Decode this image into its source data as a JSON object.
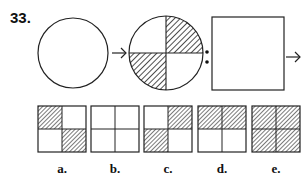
{
  "question": {
    "number": "33.",
    "sequence": [
      {
        "type": "circle",
        "divided": false,
        "shaded_quadrants": []
      },
      {
        "type": "circle",
        "divided": true,
        "shaded_quadrants": [
          "top-right",
          "bottom-left"
        ]
      },
      {
        "type": "square",
        "divided": false,
        "shaded_quadrants": []
      }
    ],
    "separator": ":"
  },
  "options": [
    {
      "label": "a.",
      "shaded": [
        "top-left",
        "bottom-right"
      ]
    },
    {
      "label": "b.",
      "shaded": []
    },
    {
      "label": "c.",
      "shaded": [
        "top-right",
        "bottom-left"
      ]
    },
    {
      "label": "d.",
      "shaded": [
        "top-left",
        "top-right"
      ]
    },
    {
      "label": "e.",
      "shaded": [
        "top-left",
        "top-right",
        "bottom-left",
        "bottom-right"
      ]
    }
  ]
}
